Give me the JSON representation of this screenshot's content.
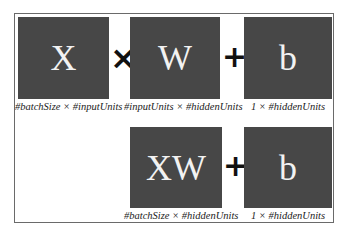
{
  "row1": {
    "boxes": [
      {
        "label": "X",
        "caption": "#batchSize × #inputUnits"
      },
      {
        "label": "W",
        "caption": "#inputUnits × #hiddenUnits"
      },
      {
        "label": "b",
        "caption": "1 × #hiddenUnits"
      }
    ],
    "operators": [
      "×",
      "+"
    ]
  },
  "row2": {
    "boxes": [
      {
        "label": "XW",
        "caption": "#batchSize × #hiddenUnits"
      },
      {
        "label": "b",
        "caption": "1 × #hiddenUnits"
      }
    ],
    "operators": [
      "+"
    ]
  },
  "colors": {
    "box_fill": "#474747",
    "box_text": "#f2f2f2",
    "border": "#6a6a6a"
  }
}
